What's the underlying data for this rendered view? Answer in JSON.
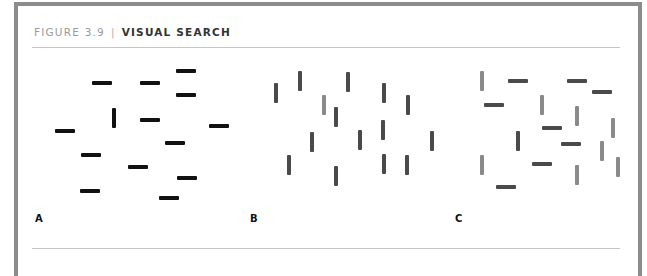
{
  "figure": {
    "number_label": "FIGURE 3.9",
    "separator": "|",
    "title": "VISUAL SEARCH"
  },
  "colors": {
    "border": "#8c8c8c",
    "black": "#111111",
    "dark_gray": "#4a4a4a",
    "light_gray": "#8a8a8a"
  },
  "panels": [
    {
      "label": "A",
      "label_x": 35,
      "marks": [
        {
          "x": 186,
          "y": 71,
          "o": "h",
          "c": "#111111"
        },
        {
          "x": 102,
          "y": 83,
          "o": "h",
          "c": "#111111"
        },
        {
          "x": 150,
          "y": 83,
          "o": "h",
          "c": "#111111"
        },
        {
          "x": 186,
          "y": 95,
          "o": "h",
          "c": "#111111"
        },
        {
          "x": 114,
          "y": 118,
          "o": "v",
          "c": "#111111"
        },
        {
          "x": 150,
          "y": 120,
          "o": "h",
          "c": "#111111"
        },
        {
          "x": 219,
          "y": 126,
          "o": "h",
          "c": "#111111"
        },
        {
          "x": 65,
          "y": 131,
          "o": "h",
          "c": "#111111"
        },
        {
          "x": 175,
          "y": 143,
          "o": "h",
          "c": "#111111"
        },
        {
          "x": 91,
          "y": 155,
          "o": "h",
          "c": "#111111"
        },
        {
          "x": 138,
          "y": 167,
          "o": "h",
          "c": "#111111"
        },
        {
          "x": 187,
          "y": 178,
          "o": "h",
          "c": "#111111"
        },
        {
          "x": 90,
          "y": 191,
          "o": "h",
          "c": "#111111"
        },
        {
          "x": 169,
          "y": 198,
          "o": "h",
          "c": "#111111"
        }
      ]
    },
    {
      "label": "B",
      "label_x": 250,
      "marks": [
        {
          "x": 276,
          "y": 93,
          "o": "v",
          "c": "#4a4a4a"
        },
        {
          "x": 300,
          "y": 81,
          "o": "v",
          "c": "#4a4a4a"
        },
        {
          "x": 348,
          "y": 82,
          "o": "v",
          "c": "#4a4a4a"
        },
        {
          "x": 384,
          "y": 93,
          "o": "v",
          "c": "#4a4a4a"
        },
        {
          "x": 324,
          "y": 105,
          "o": "v",
          "c": "#8a8a8a"
        },
        {
          "x": 408,
          "y": 105,
          "o": "v",
          "c": "#4a4a4a"
        },
        {
          "x": 336,
          "y": 117,
          "o": "v",
          "c": "#4a4a4a"
        },
        {
          "x": 383,
          "y": 130,
          "o": "v",
          "c": "#4a4a4a"
        },
        {
          "x": 312,
          "y": 142,
          "o": "v",
          "c": "#4a4a4a"
        },
        {
          "x": 360,
          "y": 140,
          "o": "v",
          "c": "#4a4a4a"
        },
        {
          "x": 432,
          "y": 141,
          "o": "v",
          "c": "#4a4a4a"
        },
        {
          "x": 289,
          "y": 165,
          "o": "v",
          "c": "#4a4a4a"
        },
        {
          "x": 384,
          "y": 164,
          "o": "v",
          "c": "#4a4a4a"
        },
        {
          "x": 407,
          "y": 165,
          "o": "v",
          "c": "#4a4a4a"
        },
        {
          "x": 336,
          "y": 176,
          "o": "v",
          "c": "#4a4a4a"
        }
      ]
    },
    {
      "label": "C",
      "label_x": 455,
      "marks": [
        {
          "x": 482,
          "y": 81,
          "o": "v",
          "c": "#8a8a8a"
        },
        {
          "x": 518,
          "y": 81,
          "o": "h",
          "c": "#4a4a4a"
        },
        {
          "x": 577,
          "y": 81,
          "o": "h",
          "c": "#4a4a4a"
        },
        {
          "x": 602,
          "y": 92,
          "o": "h",
          "c": "#4a4a4a"
        },
        {
          "x": 494,
          "y": 105,
          "o": "h",
          "c": "#4a4a4a"
        },
        {
          "x": 542,
          "y": 105,
          "o": "v",
          "c": "#8a8a8a"
        },
        {
          "x": 577,
          "y": 116,
          "o": "v",
          "c": "#8a8a8a"
        },
        {
          "x": 613,
          "y": 128,
          "o": "v",
          "c": "#8a8a8a"
        },
        {
          "x": 552,
          "y": 128,
          "o": "h",
          "c": "#4a4a4a"
        },
        {
          "x": 518,
          "y": 141,
          "o": "v",
          "c": "#4a4a4a"
        },
        {
          "x": 571,
          "y": 144,
          "o": "h",
          "c": "#4a4a4a"
        },
        {
          "x": 602,
          "y": 151,
          "o": "v",
          "c": "#8a8a8a"
        },
        {
          "x": 482,
          "y": 165,
          "o": "v",
          "c": "#8a8a8a"
        },
        {
          "x": 542,
          "y": 164,
          "o": "h",
          "c": "#4a4a4a"
        },
        {
          "x": 618,
          "y": 167,
          "o": "v",
          "c": "#8a8a8a"
        },
        {
          "x": 577,
          "y": 175,
          "o": "v",
          "c": "#8a8a8a"
        },
        {
          "x": 506,
          "y": 187,
          "o": "h",
          "c": "#4a4a4a"
        }
      ]
    }
  ]
}
